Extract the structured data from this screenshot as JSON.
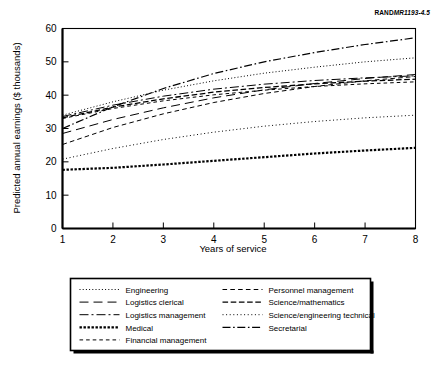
{
  "credit": {
    "brand": "RAND",
    "number": "MR1193-4.5"
  },
  "chart_data": {
    "type": "line",
    "title": "",
    "xlabel": "Years of service",
    "ylabel": "Predicted annual earnings ($ thousands)",
    "xlim": [
      1,
      8
    ],
    "ylim": [
      0,
      60
    ],
    "xticks": [
      1,
      2,
      3,
      4,
      5,
      6,
      7,
      8
    ],
    "yticks": [
      0,
      10,
      20,
      30,
      40,
      50,
      60
    ],
    "xtick_labels": [
      "1",
      "2",
      "3",
      "4",
      "5",
      "6",
      "7",
      "8"
    ],
    "ytick_labels": [
      "0",
      "10",
      "20",
      "30",
      "40",
      "50",
      "60"
    ],
    "grid": false,
    "legend_position": "below",
    "x": [
      1,
      2,
      3,
      4,
      5,
      6,
      7,
      8
    ],
    "series": [
      {
        "name": "Secretarial",
        "dash": "dashdot",
        "values": [
          30.0,
          36.5,
          42.0,
          46.5,
          50.0,
          52.8,
          55.2,
          57.2
        ]
      },
      {
        "name": "Engineering",
        "dash": "dotted",
        "values": [
          34.0,
          38.0,
          41.5,
          44.3,
          46.6,
          48.4,
          50.0,
          51.2
        ]
      },
      {
        "name": "Logistics clerical",
        "dash": "longdash",
        "values": [
          28.5,
          32.7,
          36.2,
          39.2,
          41.6,
          43.5,
          45.0,
          46.2
        ]
      },
      {
        "name": "Personnel management",
        "dash": "dashed",
        "values": [
          25.2,
          30.3,
          34.4,
          37.8,
          40.5,
          42.6,
          44.3,
          45.6
        ]
      },
      {
        "name": "Logistics management",
        "dash": "dashdotlong",
        "values": [
          33.6,
          37.0,
          39.7,
          41.8,
          43.3,
          44.4,
          45.2,
          45.8
        ]
      },
      {
        "name": "Science/mathematics",
        "dash": "mediumdash",
        "values": [
          33.2,
          36.4,
          38.9,
          40.9,
          42.3,
          43.4,
          44.2,
          44.8
        ]
      },
      {
        "name": "Financial management",
        "dash": "shortdash",
        "values": [
          33.0,
          36.0,
          38.3,
          40.1,
          41.5,
          42.6,
          43.4,
          44.0
        ]
      },
      {
        "name": "Science/engineering technical",
        "dash": "finedot",
        "values": [
          20.8,
          24.0,
          26.7,
          28.9,
          30.7,
          32.1,
          33.2,
          34.0
        ]
      },
      {
        "name": "Medical",
        "dash": "thickdot",
        "values": [
          17.6,
          18.2,
          19.2,
          20.3,
          21.4,
          22.5,
          23.4,
          24.2
        ]
      }
    ]
  },
  "legend": {
    "column_left": [
      {
        "label": "Engineering",
        "dash": "dotted"
      },
      {
        "label": "Logistics clerical",
        "dash": "longdash"
      },
      {
        "label": "Logistics management",
        "dash": "dashdotlong"
      },
      {
        "label": "Medical",
        "dash": "thickdot"
      },
      {
        "label": "Financial management",
        "dash": "shortdash"
      }
    ],
    "column_right": [
      {
        "label": "Personnel management",
        "dash": "dashed"
      },
      {
        "label": "Science/mathematics",
        "dash": "mediumdash"
      },
      {
        "label": "Science/engineering technical",
        "dash": "finedot"
      },
      {
        "label": "Secretarial",
        "dash": "dashdot"
      }
    ]
  }
}
